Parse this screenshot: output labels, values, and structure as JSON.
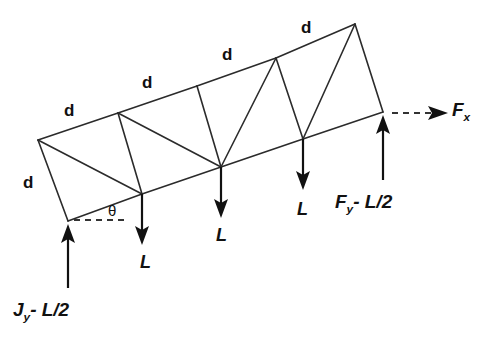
{
  "figure": {
    "type": "truss-free-body-diagram",
    "background_color": "#ffffff",
    "line_color": "#2b2b2b",
    "text_color": "#111111"
  },
  "geometry": {
    "top_chord_nodes": [
      {
        "id": "T0",
        "x": 38,
        "y": 140
      },
      {
        "id": "T1",
        "x": 118,
        "y": 113
      },
      {
        "id": "T2",
        "x": 197,
        "y": 86
      },
      {
        "id": "T3",
        "x": 276,
        "y": 58
      },
      {
        "id": "T4",
        "x": 355,
        "y": 24
      }
    ],
    "bottom_chord_nodes": [
      {
        "id": "B0",
        "x": 68,
        "y": 221
      },
      {
        "id": "B1",
        "x": 142,
        "y": 194
      },
      {
        "id": "B2",
        "x": 221,
        "y": 167
      },
      {
        "id": "B3",
        "x": 303,
        "y": 139
      },
      {
        "id": "B4",
        "x": 383,
        "y": 112
      }
    ],
    "members": [
      {
        "from": "T0",
        "to": "T1",
        "kind": "top-chord"
      },
      {
        "from": "T1",
        "to": "T2",
        "kind": "top-chord"
      },
      {
        "from": "T2",
        "to": "T3",
        "kind": "top-chord"
      },
      {
        "from": "T3",
        "to": "T4",
        "kind": "top-chord"
      },
      {
        "from": "B0",
        "to": "B1",
        "kind": "bottom-chord"
      },
      {
        "from": "B1",
        "to": "B2",
        "kind": "bottom-chord"
      },
      {
        "from": "B2",
        "to": "B3",
        "kind": "bottom-chord"
      },
      {
        "from": "B3",
        "to": "B4",
        "kind": "bottom-chord"
      },
      {
        "from": "T0",
        "to": "B0",
        "kind": "end-post"
      },
      {
        "from": "T4",
        "to": "B4",
        "kind": "end-post"
      },
      {
        "from": "T0",
        "to": "B1",
        "kind": "diagonal"
      },
      {
        "from": "T1",
        "to": "B1",
        "kind": "vertical-web"
      },
      {
        "from": "T1",
        "to": "B2",
        "kind": "diagonal"
      },
      {
        "from": "T2",
        "to": "B2",
        "kind": "vertical-web"
      },
      {
        "from": "T3",
        "to": "B2",
        "kind": "diagonal"
      },
      {
        "from": "T3",
        "to": "B3",
        "kind": "vertical-web"
      },
      {
        "from": "T4",
        "to": "B3",
        "kind": "diagonal"
      }
    ]
  },
  "labels": {
    "segment_d": "d",
    "load_L": "L",
    "angle_theta": "θ",
    "d_positions": [
      {
        "x": 64,
        "y": 102,
        "name": "d-label-top-1"
      },
      {
        "x": 142,
        "y": 74,
        "name": "d-label-top-2"
      },
      {
        "x": 222,
        "y": 46,
        "name": "d-label-top-3"
      },
      {
        "x": 301,
        "y": 19,
        "name": "d-label-top-4"
      },
      {
        "x": 23,
        "y": 174,
        "name": "d-label-end-post"
      }
    ],
    "L_positions": [
      {
        "x": 140,
        "y": 253,
        "name": "load-label-1"
      },
      {
        "x": 216,
        "y": 226,
        "name": "load-label-2"
      },
      {
        "x": 297,
        "y": 200,
        "name": "load-label-3"
      }
    ],
    "theta_position": {
      "x": 108,
      "y": 203
    }
  },
  "forces": {
    "reaction_left": {
      "label_main": "J",
      "label_sub": "y",
      "label_rest": "- L/2",
      "full_text": "J y - L/2",
      "direction": "up",
      "applied_at_node": "B0",
      "label_x": 13,
      "label_y": 300
    },
    "reaction_right_vertical": {
      "label_main": "F",
      "label_sub": "y",
      "label_rest": "- L/2",
      "full_text": "F y - L/2",
      "direction": "up",
      "applied_at_node": "B4",
      "label_x": 335,
      "label_y": 192
    },
    "reaction_right_horizontal": {
      "label_main": "F",
      "label_sub": "x",
      "label_rest": "",
      "full_text": "F x",
      "direction": "right",
      "style": "dashed",
      "applied_at_node": "B4",
      "label_x": 452,
      "label_y": 100
    },
    "loads": [
      {
        "name": "load-1",
        "label": "L",
        "direction": "down",
        "applied_at_node": "B1"
      },
      {
        "name": "load-2",
        "label": "L",
        "direction": "down",
        "applied_at_node": "B2"
      },
      {
        "name": "load-3",
        "label": "L",
        "direction": "down",
        "applied_at_node": "B3"
      }
    ]
  }
}
